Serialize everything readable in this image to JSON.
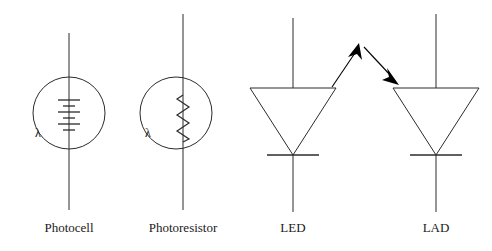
{
  "figure": {
    "background_color": "#ffffff",
    "line_color": "#2b2b2b",
    "arrow_color": "#000000",
    "width": 492,
    "height": 251
  },
  "symbols": [
    {
      "id": "photocell",
      "label": "Photocell",
      "kind": "photovoltaic-cell",
      "lambda_marker": "λ",
      "envelope": {
        "shape": "circle",
        "cx": 69,
        "cy": 113,
        "r": 36
      },
      "lead": {
        "x": 69,
        "y_top": 33,
        "y_bottom": 210
      },
      "plates": {
        "count": 3,
        "long_half_width": 11,
        "short_half_width": 6,
        "y_start": 100,
        "spacing": 6
      },
      "label_position": {
        "x": 69,
        "y": 232
      }
    },
    {
      "id": "photoresistor",
      "label": "Photoresistor",
      "kind": "light-dependent-resistor",
      "lambda_marker": "λ",
      "envelope": {
        "shape": "circle",
        "cx": 176,
        "cy": 113,
        "r": 36
      },
      "lead": {
        "x": 183,
        "y_top": 14,
        "y_bottom": 210
      },
      "zigzag": {
        "x": 183,
        "y_start": 95,
        "y_end": 142,
        "amplitude": 6,
        "peaks": 5
      },
      "label_position": {
        "x": 183,
        "y": 232
      }
    },
    {
      "id": "led",
      "label": "LED",
      "kind": "light-emitting-diode",
      "triangle": {
        "cx": 293,
        "top_y": 88,
        "half_width": 43,
        "apex_y": 155
      },
      "cathode_bar": {
        "cx": 293,
        "y": 155,
        "half_width": 26
      },
      "lead_top": {
        "x": 293,
        "y_top": 18,
        "y_bottom": 88
      },
      "lead_bottom": {
        "x": 293,
        "y_top": 155,
        "y_bottom": 212
      },
      "label_position": {
        "x": 293,
        "y": 232
      }
    },
    {
      "id": "lad",
      "label": "LAD",
      "kind": "light-activated-diode",
      "triangle": {
        "cx": 436,
        "top_y": 88,
        "half_width": 43,
        "apex_y": 155
      },
      "cathode_bar": {
        "cx": 436,
        "y": 155,
        "half_width": 26
      },
      "lead_top": {
        "x": 436,
        "y_top": 14,
        "y_bottom": 88
      },
      "lead_bottom": {
        "x": 436,
        "y_top": 155,
        "y_bottom": 212
      },
      "label_position": {
        "x": 436,
        "y": 232
      }
    }
  ],
  "light_path": {
    "description": "light emitted by the LED travels up and across into the LAD",
    "outgoing_ray": {
      "x1": 332,
      "y1": 87,
      "x2": 360,
      "y2": 45
    },
    "incoming_ray": {
      "x1": 363,
      "y1": 46,
      "x2": 397,
      "y2": 84
    }
  }
}
